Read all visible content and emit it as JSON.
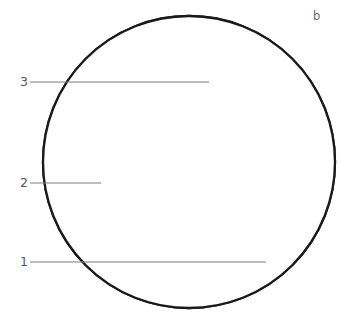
{
  "figure": {
    "panel_label": "b",
    "background_color": "#ffffff",
    "outline_color": "#1a1a1a",
    "shade_color": "#ededed",
    "hatch_color": "#111111",
    "leader_color": "#7d7d7d",
    "label_color": "#575757"
  },
  "circle": {
    "center_x": 189,
    "center_y": 162,
    "radius": 146
  },
  "callouts": [
    {
      "id": "callout-1",
      "label": "1",
      "label_x": 20,
      "label_y": 262,
      "line_x1": 30,
      "line_x2": 266,
      "line_y": 262
    },
    {
      "id": "callout-2",
      "label": "2",
      "label_x": 20,
      "label_y": 183,
      "line_x1": 30,
      "line_x2": 101,
      "line_y": 183
    },
    {
      "id": "callout-3",
      "label": "3",
      "label_x": 20,
      "label_y": 82,
      "line_x1": 30,
      "line_x2": 209,
      "line_y": 82
    }
  ],
  "zones": [
    {
      "id": "zone-white-outer",
      "name": "unshaded-matrix-zone",
      "fill": "#ffffff",
      "description": "outer white region of the circular field"
    },
    {
      "id": "zone-lamellar-band",
      "name": "hatched-lamellar-band",
      "fill": "none",
      "hatch_count": 12,
      "description": "band of curved parallel lamella lines in the upper right"
    },
    {
      "id": "zone-shaded-core",
      "name": "grey-shaded-core-zone",
      "fill": "#ededed",
      "description": "light grey funnel-shaped region narrowing toward the bottom"
    }
  ],
  "geometry": {
    "shade_path": "M 162 183 L 160 181 C 178 158 230 110 313 79 C 327 96 333 121 334 152 C 316 159 282 183 256 216 C 236 243 222 270 214 308 L 188 309 C 192 282 196 263 196 250 C 196 236 190 228 182 222 C 174 216 168 206 165 196 Z",
    "shade_border_left": "M 160 181 C 162 189 166 200 172 210 C 180 221 190 228 191 243 C 192 258 186 275 176 290 C 170 299 165 305 161 310",
    "shade_border_right": "M 334 152 C 316 159 282 183 256 216 C 236 243 222 270 214 308",
    "hatch_lines": [
      "M 304 31 C 268 43 228 62 196 85 C 179 97 166 108 155 118",
      "M 310 41 C 274 53 233 73 201 96 C 184 108 170 120 159 130",
      "M 316 51 C 280 63 239 84 206 107 C 189 119 175 131 163 141",
      "M 321 61 C 285 73 244 94 211 118 C 193 130 179 143 167 153",
      "M 325 71 C 289 83 248 105 215 129 C 197 141 182 154 170 165",
      "M 329 82 C 293 94 252 116 219 140 C 201 152 186 165 173 176",
      "M 332 93 C 296 105 256 127 223 151 C 205 163 189 176 176 187",
      "M 334 104 C 298 116 259 138 226 162 C 208 174 192 187 178 198",
      "M 335 116 C 300 128 261 150 228 174 C 210 186 194 198 180 209",
      "M 336 128 C 301 140 262 162 230 185 C 212 197 195 209 181 220",
      "M 336 140 C 302 152 263 173 231 196 C 213 208 196 220 182 231",
      "M 335 152 C 302 164 263 184 232 207 C 214 219 197 230 183 241"
    ],
    "lamellar_outer_edge": "M 297 22 C 258 36 216 58 184 82 C 165 96 152 108 142 118",
    "lamellar_inner_edge": "M 334 152 C 302 164 263 184 232 207 C 214 219 197 230 183 241"
  }
}
